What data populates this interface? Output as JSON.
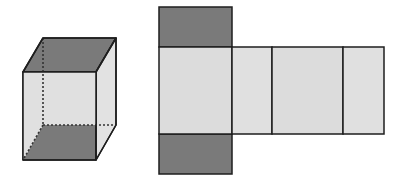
{
  "figure": {
    "colors": {
      "dark_face": "#7a7a7a",
      "light_face": "#dcdcdc",
      "side_face": "#e6e6e6",
      "edge": "#1e1e1e",
      "background": "#ffffff"
    },
    "prism": {
      "front_face": {
        "x": 23,
        "y": 72,
        "w": 73,
        "h": 88
      },
      "depth_offset": {
        "dx": 20,
        "dy": -34
      }
    },
    "net": {
      "top_face": {
        "x": 159,
        "y": 7,
        "w": 73,
        "h": 40
      },
      "bottom_face": {
        "x": 159,
        "y": 134,
        "w": 73,
        "h": 40
      },
      "side_faces": [
        {
          "x": 159,
          "y": 47,
          "w": 73,
          "h": 87
        },
        {
          "x": 232,
          "y": 47,
          "w": 40,
          "h": 87
        },
        {
          "x": 272,
          "y": 47,
          "w": 71,
          "h": 87
        },
        {
          "x": 343,
          "y": 47,
          "w": 41,
          "h": 87
        }
      ]
    }
  }
}
